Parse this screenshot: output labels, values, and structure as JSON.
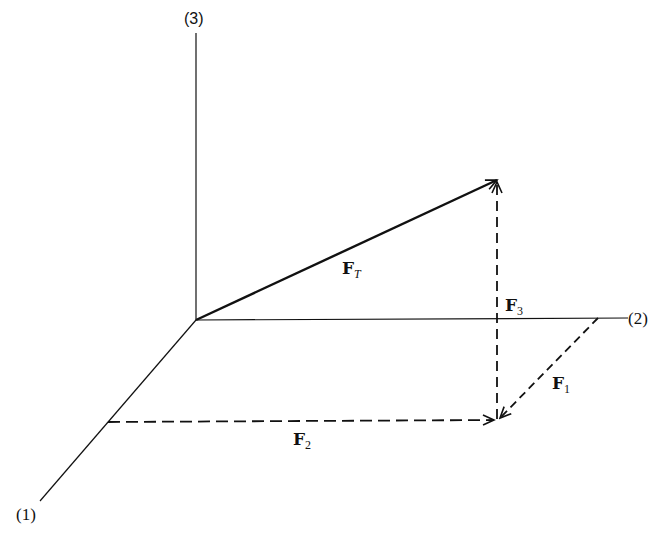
{
  "diagram": {
    "title": "",
    "axes": [
      {
        "id": "axis-1",
        "label": "(1)"
      },
      {
        "id": "axis-2",
        "label": "(2)"
      },
      {
        "id": "axis-3",
        "label": "(3)"
      }
    ],
    "vectors": [
      {
        "id": "F_T",
        "symbol": "F",
        "subscript": "T",
        "style": "solid"
      },
      {
        "id": "F_1",
        "symbol": "F",
        "subscript": "1",
        "style": "dashed"
      },
      {
        "id": "F_2",
        "symbol": "F",
        "subscript": "2",
        "style": "dashed"
      },
      {
        "id": "F_3",
        "symbol": "F",
        "subscript": "3",
        "style": "dashed"
      }
    ],
    "colors": {
      "line": "#111111",
      "background": "#ffffff"
    }
  }
}
